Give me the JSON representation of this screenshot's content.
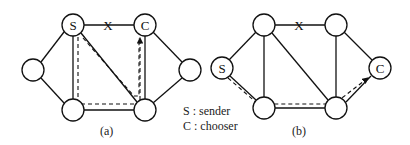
{
  "figure_a": {
    "caption": "(a)",
    "nodes": [
      {
        "id": "S",
        "label": "S",
        "x": 73,
        "y": 25
      },
      {
        "id": "C",
        "label": "C",
        "x": 145,
        "y": 25
      },
      {
        "id": "L",
        "label": "",
        "x": 33,
        "y": 70
      },
      {
        "id": "BL",
        "label": "",
        "x": 73,
        "y": 110
      },
      {
        "id": "BR",
        "label": "",
        "x": 145,
        "y": 110
      },
      {
        "id": "R",
        "label": "",
        "x": 190,
        "y": 70
      }
    ],
    "edge_break_label": "X"
  },
  "figure_b": {
    "caption": "(b)",
    "nodes": [
      {
        "id": "TL",
        "label": "",
        "x": 264,
        "y": 25
      },
      {
        "id": "TR",
        "label": "",
        "x": 336,
        "y": 25
      },
      {
        "id": "S",
        "label": "S",
        "x": 222,
        "y": 68
      },
      {
        "id": "BL",
        "label": "",
        "x": 264,
        "y": 108
      },
      {
        "id": "BR",
        "label": "",
        "x": 336,
        "y": 108
      },
      {
        "id": "C",
        "label": "C",
        "x": 380,
        "y": 68
      }
    ],
    "edge_break_label": "X"
  },
  "legend": {
    "sender": "S : sender",
    "chooser": "C : chooser"
  }
}
